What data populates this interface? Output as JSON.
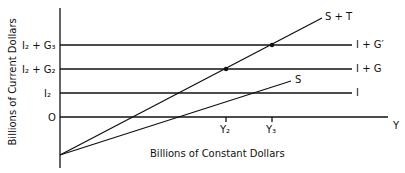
{
  "diagram": {
    "y_axis_label": "Billions of Current Dollars",
    "x_axis_label": "Billions of Constant Dollars",
    "x_axis_end_label": "Y",
    "y_ticks": {
      "i2_g3": "I₂ + G₃",
      "i2_g2": "I₂ + G₂",
      "i2": "I₂",
      "zero": "O"
    },
    "x_ticks": {
      "y2": "Y₂",
      "y3": "Y₃"
    },
    "line_labels": {
      "s_plus_t": "S + T",
      "i_plus_g_prime": "I + G′",
      "i_plus_g": "I + G",
      "s": "S",
      "i": "I"
    }
  }
}
